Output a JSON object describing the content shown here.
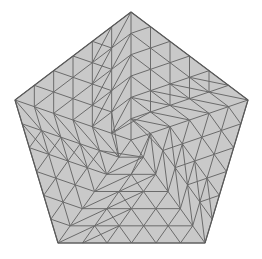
{
  "figure": {
    "title": "Triangulated pentagon mesh",
    "type": "mesh-diagram",
    "width": 262,
    "height": 259,
    "background_color": "#ffffff"
  },
  "style": {
    "fill_color": "#c9c9c9",
    "edge_color": "#6b6b6b",
    "boundary_color": "#5a5a5a",
    "edge_width": 1.0,
    "boundary_width": 1.2
  },
  "mesh": {
    "shape": "pentagon",
    "center": [
      131.0,
      140.0
    ],
    "boundary_vertices": [
      [
        131.0,
        12.0
      ],
      [
        248.0,
        100.0
      ],
      [
        205.0,
        243.0
      ],
      [
        58.0,
        243.0
      ],
      [
        15.0,
        100.0
      ]
    ],
    "boundary_divisions": 6,
    "radial_rings": 6,
    "vertex_count": 96,
    "triangle_count": 160,
    "nodes": [
      [
        131.0,
        140.0
      ],
      [
        131.0,
        118.67
      ],
      [
        151.28,
        133.41
      ],
      [
        143.53,
        157.26
      ],
      [
        118.47,
        157.26
      ],
      [
        110.72,
        133.41
      ],
      [
        131.0,
        97.33
      ],
      [
        150.41,
        111.44
      ],
      [
        171.56,
        126.81
      ],
      [
        163.17,
        152.6
      ],
      [
        156.06,
        174.51
      ],
      [
        143.0,
        174.51
      ],
      [
        119.0,
        174.51
      ],
      [
        105.94,
        174.51
      ],
      [
        98.83,
        152.6
      ],
      [
        90.44,
        126.81
      ],
      [
        111.59,
        111.44
      ],
      [
        131.0,
        76.0
      ],
      [
        149.56,
        89.48
      ],
      [
        170.45,
        104.65
      ],
      [
        191.84,
        120.22
      ],
      [
        184.09,
        144.07
      ],
      [
        175.96,
        169.09
      ],
      [
        168.39,
        184.36
      ],
      [
        155.5,
        195.77
      ],
      [
        143.0,
        195.77
      ],
      [
        131.0,
        195.77
      ],
      [
        119.0,
        195.77
      ],
      [
        106.5,
        195.77
      ],
      [
        93.61,
        184.36
      ],
      [
        86.04,
        169.09
      ],
      [
        77.91,
        144.07
      ],
      [
        70.16,
        120.22
      ],
      [
        91.55,
        104.65
      ],
      [
        112.44,
        89.48
      ],
      [
        131.0,
        54.67
      ],
      [
        148.69,
        67.52
      ],
      [
        169.34,
        82.52
      ],
      [
        190.73,
        98.09
      ],
      [
        212.12,
        113.63
      ],
      [
        204.37,
        137.48
      ],
      [
        196.24,
        162.5
      ],
      [
        188.42,
        186.58
      ],
      [
        180.85,
        201.85
      ],
      [
        168.0,
        213.26
      ],
      [
        155.5,
        217.02
      ],
      [
        143.0,
        217.02
      ],
      [
        131.0,
        217.02
      ],
      [
        119.0,
        217.02
      ],
      [
        106.5,
        217.02
      ],
      [
        94.0,
        213.26
      ],
      [
        81.15,
        201.85
      ],
      [
        73.58,
        186.58
      ],
      [
        65.76,
        162.5
      ],
      [
        57.63,
        137.48
      ],
      [
        49.88,
        113.63
      ],
      [
        71.27,
        98.09
      ],
      [
        92.66,
        82.52
      ],
      [
        113.31,
        67.52
      ],
      [
        131.0,
        33.33
      ],
      [
        147.83,
        45.76
      ],
      [
        168.23,
        60.39
      ],
      [
        189.62,
        75.96
      ],
      [
        211.01,
        91.52
      ],
      [
        232.4,
        107.09
      ],
      [
        224.65,
        130.94
      ],
      [
        216.52,
        155.96
      ],
      [
        208.7,
        180.04
      ],
      [
        201.12,
        195.31
      ],
      [
        188.0,
        213.26
      ],
      [
        180.0,
        230.0
      ],
      [
        168.0,
        234.0
      ],
      [
        155.5,
        238.39
      ],
      [
        143.0,
        238.39
      ],
      [
        131.0,
        238.39
      ],
      [
        119.0,
        238.39
      ],
      [
        106.5,
        238.39
      ],
      [
        94.0,
        234.0
      ],
      [
        82.0,
        230.0
      ],
      [
        74.0,
        213.26
      ],
      [
        60.88,
        195.31
      ],
      [
        53.3,
        180.04
      ],
      [
        45.48,
        155.96
      ],
      [
        37.35,
        130.94
      ],
      [
        29.6,
        107.09
      ],
      [
        50.99,
        91.52
      ],
      [
        72.38,
        75.96
      ],
      [
        93.77,
        60.39
      ],
      [
        114.17,
        45.76
      ]
    ]
  }
}
